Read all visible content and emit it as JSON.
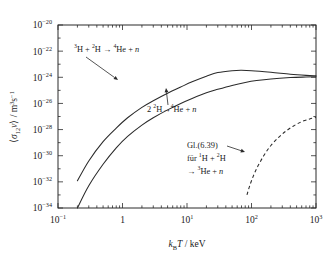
{
  "figure": {
    "name": "reaction-rate-coefficient-plot",
    "background_color": "#ffffff",
    "line_color": "#2a2a2a"
  },
  "axes": {
    "x": {
      "label_parts": {
        "k": "k",
        "sub": "B",
        "T": "T",
        "unit": " / keV"
      },
      "label_text": "kBT / keV",
      "scale": "log",
      "min_exponent": -1,
      "max_exponent": 3,
      "tick_labels": [
        "10⁻¹",
        "1",
        "10¹",
        "10²",
        "10³"
      ],
      "tick_mantissas": [
        "10",
        "1",
        "10",
        "10",
        "10"
      ],
      "tick_exponents": [
        "-1",
        "",
        "1",
        "2",
        "3"
      ],
      "minor_ticks": true
    },
    "y": {
      "label_text": "⟨σ12v⟩ / m³s⁻¹",
      "label_parts": {
        "open": "⟨",
        "sigma": "σ",
        "sub": "12",
        "v": "v",
        "close": "⟩",
        "unit_pre": " / m",
        "unit_sup1": "3",
        "unit_s": "s",
        "unit_sup2": "−1"
      },
      "scale": "log",
      "min_exponent": -34,
      "max_exponent": -20,
      "tick_labels": [
        "10⁻³⁴",
        "10⁻³²",
        "10⁻³⁰",
        "10⁻²⁸",
        "10⁻²⁶",
        "10⁻²⁴",
        "10⁻²²",
        "10⁻²⁰"
      ],
      "tick_exponents": [
        "-34",
        "-32",
        "-30",
        "-28",
        "-26",
        "-24",
        "-22",
        "-20"
      ],
      "minor_ticks": true
    }
  },
  "annotations": [
    {
      "id": "annot-dt",
      "text": "³H + ²H → ⁴He + n",
      "runs": [
        {
          "sup": "3",
          "text": "H + "
        },
        {
          "sup": "2",
          "text": "H "
        },
        {
          "sup": "",
          "text": "→ "
        },
        {
          "sup": "4",
          "text": "He + "
        },
        {
          "sup": "",
          "text": "n",
          "italic": true
        }
      ],
      "x": 74,
      "y": 52,
      "arrow": {
        "x1": 86,
        "y1": 57,
        "x2": 118,
        "y2": 80
      }
    },
    {
      "id": "annot-dd",
      "text": "2 ²H → ⁴He + n",
      "runs": [
        {
          "sup": "",
          "text": "2 "
        },
        {
          "sup": "2",
          "text": "H"
        },
        {
          "sup": "",
          "text": "→"
        },
        {
          "sup": "4",
          "text": "He + "
        },
        {
          "sup": "",
          "text": "n",
          "italic": true
        }
      ],
      "x": 147,
      "y": 112,
      "arrow": {
        "x1": 168,
        "y1": 105,
        "x2": 166,
        "y2": 88
      }
    },
    {
      "id": "annot-gl639",
      "lines": [
        {
          "runs": [
            {
              "sup": "",
              "text": "Gl.(6.39)"
            }
          ]
        },
        {
          "runs": [
            {
              "sup": "",
              "text": "für "
            },
            {
              "sup": "1",
              "text": "H + "
            },
            {
              "sup": "2",
              "text": "H"
            }
          ]
        },
        {
          "runs": [
            {
              "sup": "",
              "text": "→ "
            },
            {
              "sup": "3",
              "text": "He + "
            },
            {
              "sup": "",
              "text": "n",
              "italic": true
            }
          ]
        }
      ],
      "x": 187,
      "y": 148,
      "line_height": 13,
      "arrow": {
        "x1": 227,
        "y1": 146,
        "x2": 245,
        "y2": 152
      }
    }
  ],
  "chart_data": {
    "type": "line",
    "title": "",
    "xlabel": "kBT / keV",
    "ylabel": "<sigma_12 v> / m^3 s^-1",
    "xscale": "log",
    "yscale": "log",
    "xlim": [
      0.1,
      1000
    ],
    "ylim": [
      1e-34,
      1e-20
    ],
    "grid": false,
    "legend": "none",
    "series": [
      {
        "name": "3H + 2H -> 4He + n",
        "style": "solid",
        "x": [
          0.2,
          0.3,
          0.5,
          0.8,
          1.2,
          2,
          3,
          5,
          8,
          12,
          20,
          30,
          50,
          70,
          100,
          200,
          400,
          700,
          1000
        ],
        "y": [
          1.2e-32,
          4e-31,
          1.2e-29,
          1.3e-28,
          8e-28,
          5e-27,
          1.6e-26,
          6e-26,
          1.8e-25,
          4.5e-25,
          1.2e-24,
          2.3e-24,
          3.2e-24,
          3.4e-24,
          3.2e-24,
          2.4e-24,
          1.7e-24,
          1.4e-24,
          1.3e-24
        ]
      },
      {
        "name": "2 2H -> 4He + n",
        "style": "solid",
        "x": [
          0.2,
          0.3,
          0.5,
          0.8,
          1.2,
          2,
          3,
          5,
          8,
          12,
          20,
          30,
          50,
          80,
          120,
          200,
          400,
          700,
          1000
        ],
        "y": [
          1e-34,
          5e-33,
          2.2e-31,
          4e-30,
          3e-29,
          2.2e-28,
          8e-28,
          3.2e-27,
          1e-26,
          2.4e-26,
          6.5e-26,
          1.2e-25,
          2.4e-25,
          4e-25,
          5.6e-25,
          7.5e-25,
          9.5e-25,
          1.05e-24,
          1.1e-24
        ]
      },
      {
        "name": "Gl.(6.39) fur 1H + 2H -> 3He + n",
        "style": "dashed",
        "x": [
          85,
          95,
          110,
          130,
          160,
          200,
          260,
          340,
          450,
          600,
          800,
          1000
        ],
        "y": [
          1e-33,
          6e-33,
          4e-32,
          2.2e-31,
          1.3e-30,
          6e-30,
          2.4e-29,
          7.5e-29,
          1.9e-28,
          4e-28,
          6.5e-28,
          8.5e-28
        ]
      }
    ]
  }
}
